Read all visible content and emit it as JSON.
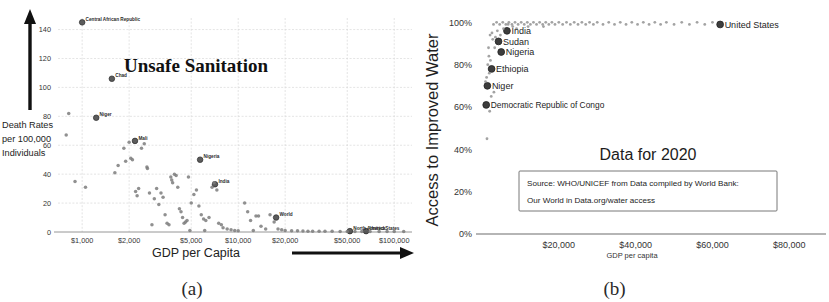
{
  "figure": {
    "panel_a_caption": "(a)",
    "panel_b_caption": "(b)"
  },
  "chart_data": [
    {
      "type": "scatter",
      "panel": "a",
      "title": "Unsafe Sanitation",
      "xlabel": "GDP per Capita",
      "ylabel": "Death Rates per 100,000 Individuals",
      "ylabel_lines": [
        "Death Rates",
        "per 100,000",
        "Individuals"
      ],
      "xscale": "log",
      "xlim": [
        700,
        130000
      ],
      "ylim": [
        0,
        148
      ],
      "grid": true,
      "xticks": [
        1000,
        2000,
        5000,
        10000,
        20000,
        50000,
        100000
      ],
      "xticklabels": [
        "$1,000",
        "$2,000",
        "$5,000",
        "$10,000",
        "$20,000",
        "$50,000",
        "$100,000"
      ],
      "yticks": [
        0,
        20,
        40,
        60,
        80,
        100,
        120,
        140
      ],
      "yticklabels": [
        "0",
        "20",
        "40",
        "60",
        "80",
        "100",
        "120",
        "140"
      ],
      "x_axis_arrow": true,
      "y_axis_arrow": true,
      "annotations": [
        {
          "label": "Central African Republic",
          "x": 1000,
          "y": 145
        },
        {
          "label": "Chad",
          "x": 1550,
          "y": 106
        },
        {
          "label": "Niger",
          "x": 1230,
          "y": 79
        },
        {
          "label": "Mali",
          "x": 2180,
          "y": 63
        },
        {
          "label": "Nigeria",
          "x": 5700,
          "y": 50
        },
        {
          "label": "India",
          "x": 7100,
          "y": 33
        },
        {
          "label": "World",
          "x": 17500,
          "y": 10
        },
        {
          "label": "North America",
          "x": 52000,
          "y": 0.6
        },
        {
          "label": "United States",
          "x": 66000,
          "y": 0.6
        }
      ],
      "points": [
        [
          1000,
          145
        ],
        [
          1550,
          106
        ],
        [
          1230,
          79
        ],
        [
          2180,
          63
        ],
        [
          5700,
          50
        ],
        [
          7100,
          33
        ],
        [
          17500,
          10
        ],
        [
          52000,
          0.6
        ],
        [
          66000,
          0.6
        ],
        [
          820,
          82
        ],
        [
          790,
          67
        ],
        [
          900,
          35
        ],
        [
          1050,
          31
        ],
        [
          1620,
          41
        ],
        [
          1700,
          46
        ],
        [
          1850,
          58
        ],
        [
          1900,
          49
        ],
        [
          2000,
          62
        ],
        [
          2050,
          51
        ],
        [
          2100,
          50
        ],
        [
          2200,
          28
        ],
        [
          2250,
          25
        ],
        [
          2300,
          30
        ],
        [
          2400,
          58
        ],
        [
          2500,
          61
        ],
        [
          2600,
          45
        ],
        [
          2620,
          44
        ],
        [
          2700,
          27
        ],
        [
          2900,
          23
        ],
        [
          3000,
          30
        ],
        [
          3100,
          19
        ],
        [
          3200,
          27
        ],
        [
          3400,
          12
        ],
        [
          3500,
          6
        ],
        [
          3600,
          5
        ],
        [
          3700,
          38
        ],
        [
          3750,
          36
        ],
        [
          3800,
          34
        ],
        [
          3900,
          40
        ],
        [
          4000,
          39
        ],
        [
          4100,
          31
        ],
        [
          4200,
          16
        ],
        [
          4300,
          14
        ],
        [
          4400,
          10
        ],
        [
          4500,
          6
        ],
        [
          4600,
          7
        ],
        [
          4700,
          8
        ],
        [
          4800,
          38
        ],
        [
          5000,
          20
        ],
        [
          5200,
          26
        ],
        [
          5400,
          29
        ],
        [
          5600,
          18
        ],
        [
          5800,
          12
        ],
        [
          6000,
          9
        ],
        [
          6200,
          8
        ],
        [
          6500,
          10
        ],
        [
          6800,
          31
        ],
        [
          7000,
          34
        ],
        [
          7300,
          29
        ],
        [
          7500,
          6
        ],
        [
          7800,
          5
        ],
        [
          8000,
          3
        ],
        [
          8500,
          2
        ],
        [
          9000,
          1.5
        ],
        [
          9500,
          1
        ],
        [
          10000,
          0.8
        ],
        [
          11000,
          20
        ],
        [
          11500,
          14
        ],
        [
          12000,
          8
        ],
        [
          13000,
          11
        ],
        [
          13500,
          11
        ],
        [
          14000,
          4
        ],
        [
          15000,
          2
        ],
        [
          16000,
          12
        ],
        [
          17000,
          7
        ],
        [
          18000,
          2
        ],
        [
          19000,
          1.5
        ],
        [
          20000,
          1
        ],
        [
          22000,
          0.9
        ],
        [
          24000,
          0.8
        ],
        [
          26000,
          0.7
        ],
        [
          28000,
          0.6
        ],
        [
          30000,
          0.6
        ],
        [
          33000,
          0.5
        ],
        [
          36000,
          0.5
        ],
        [
          40000,
          0.5
        ],
        [
          45000,
          0.4
        ],
        [
          50000,
          0.4
        ],
        [
          56000,
          0.4
        ],
        [
          62000,
          0.3
        ],
        [
          70000,
          0.3
        ],
        [
          80000,
          0.3
        ],
        [
          90000,
          0.3
        ],
        [
          100000,
          0.3
        ],
        [
          115000,
          0.3
        ],
        [
          2800,
          5
        ],
        [
          3300,
          24
        ],
        [
          4900,
          1
        ],
        [
          6100,
          1
        ],
        [
          12500,
          1
        ]
      ]
    },
    {
      "type": "scatter",
      "panel": "b",
      "title": "Data for 2020",
      "xlabel": "GDP per capita",
      "ylabel": "Access to Improved Water",
      "xscale": "linear",
      "xlim": [
        0,
        88000
      ],
      "ylim": [
        0,
        103
      ],
      "grid": false,
      "xticks": [
        20000,
        40000,
        60000,
        80000
      ],
      "xticklabels": [
        "$20,000",
        "$40,000",
        "$60,000",
        "$80,000"
      ],
      "yticks": [
        0,
        20,
        40,
        60,
        80,
        100
      ],
      "yticklabels": [
        "0%",
        "20%",
        "40%",
        "60%",
        "80%",
        "100%"
      ],
      "source_note_lines": [
        "Source: WHO/UNICEF from Data compiled by World Bank:",
        "Our World in Data.org/water access"
      ],
      "annotations": [
        {
          "label": "India",
          "x": 6500,
          "y": 96
        },
        {
          "label": "Sudan",
          "x": 4300,
          "y": 91
        },
        {
          "label": "Nigeria",
          "x": 5000,
          "y": 86
        },
        {
          "label": "Ethiopia",
          "x": 2500,
          "y": 78
        },
        {
          "label": "Niger",
          "x": 1400,
          "y": 70
        },
        {
          "label": "Democratic Republic of Congo",
          "x": 1100,
          "y": 61
        },
        {
          "label": "United States",
          "x": 62000,
          "y": 99
        }
      ],
      "points": [
        [
          6500,
          96
        ],
        [
          4300,
          91
        ],
        [
          5000,
          86
        ],
        [
          2500,
          78
        ],
        [
          1400,
          70
        ],
        [
          1100,
          61
        ],
        [
          62000,
          99
        ],
        [
          3000,
          99
        ],
        [
          3800,
          100
        ],
        [
          4600,
          99
        ],
        [
          5400,
          100
        ],
        [
          6200,
          99
        ],
        [
          7000,
          100
        ],
        [
          7800,
          99
        ],
        [
          8600,
          100
        ],
        [
          9400,
          99
        ],
        [
          10200,
          100
        ],
        [
          11000,
          99
        ],
        [
          11800,
          100
        ],
        [
          12600,
          99
        ],
        [
          13400,
          100
        ],
        [
          14200,
          99
        ],
        [
          15000,
          100
        ],
        [
          15800,
          99
        ],
        [
          16600,
          100
        ],
        [
          17400,
          99
        ],
        [
          18200,
          100
        ],
        [
          19000,
          99
        ],
        [
          20000,
          100
        ],
        [
          21000,
          99
        ],
        [
          22000,
          100
        ],
        [
          23000,
          99
        ],
        [
          24000,
          100
        ],
        [
          25000,
          99
        ],
        [
          26000,
          100
        ],
        [
          27000,
          99
        ],
        [
          28000,
          100
        ],
        [
          29000,
          99
        ],
        [
          30000,
          100
        ],
        [
          31500,
          99
        ],
        [
          33000,
          100
        ],
        [
          34500,
          99
        ],
        [
          36000,
          100
        ],
        [
          37500,
          99
        ],
        [
          39000,
          100
        ],
        [
          40500,
          99
        ],
        [
          42000,
          100
        ],
        [
          43500,
          99
        ],
        [
          45000,
          100
        ],
        [
          46500,
          99
        ],
        [
          48000,
          100
        ],
        [
          50000,
          99
        ],
        [
          52000,
          100
        ],
        [
          54000,
          99
        ],
        [
          56000,
          100
        ],
        [
          58000,
          99
        ],
        [
          60000,
          100
        ],
        [
          2100,
          94
        ],
        [
          2800,
          92
        ],
        [
          3300,
          88
        ],
        [
          1800,
          84
        ],
        [
          2200,
          82
        ],
        [
          1500,
          80
        ],
        [
          1900,
          76
        ],
        [
          1200,
          74
        ],
        [
          900,
          72
        ],
        [
          1700,
          88
        ],
        [
          2600,
          95
        ],
        [
          3500,
          93
        ],
        [
          4000,
          96
        ],
        [
          4800,
          94
        ],
        [
          5600,
          97
        ],
        [
          1300,
          45
        ],
        [
          2000,
          58
        ],
        [
          2400,
          65
        ],
        [
          3100,
          67
        ],
        [
          6800,
          99
        ],
        [
          8000,
          98
        ],
        [
          9000,
          97
        ],
        [
          12000,
          98
        ],
        [
          16000,
          98
        ]
      ]
    }
  ]
}
